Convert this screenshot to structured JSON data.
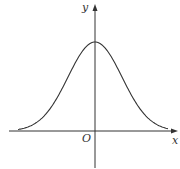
{
  "figure": {
    "labels": {
      "y_axis": "y",
      "x_axis": "x",
      "origin": "O"
    },
    "colors": {
      "stroke": "#333333",
      "background": "#ffffff"
    }
  },
  "chart_data": {
    "type": "line",
    "title": "",
    "xlabel": "x",
    "ylabel": "y",
    "origin_label": "O",
    "grid": false,
    "curve": "bell-shaped (Gaussian-like), symmetric about y-axis, maximum on y-axis, approaching x-axis asymptotically on both sides",
    "x": [
      -3,
      -2.5,
      -2,
      -1.5,
      -1,
      -0.5,
      0,
      0.5,
      1,
      1.5,
      2,
      2.5,
      3
    ],
    "values": [
      0.06,
      0.14,
      0.29,
      0.5,
      0.73,
      0.92,
      1.0,
      0.92,
      0.73,
      0.5,
      0.29,
      0.14,
      0.06
    ]
  }
}
